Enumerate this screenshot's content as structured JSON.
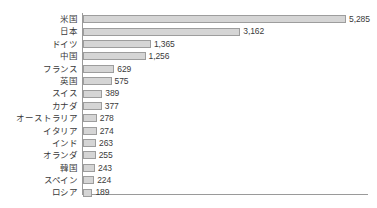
{
  "chart_data": {
    "type": "bar",
    "orientation": "horizontal",
    "title": "",
    "subtitle": "",
    "xlabel": "",
    "ylabel": "",
    "grid": false,
    "legend": null,
    "legend_position": "none",
    "xlim": [
      0,
      5285
    ],
    "axis_origin": 0,
    "value_label_format": "thousands-separated",
    "categories": [
      "米国",
      "日本",
      "ドイツ",
      "中国",
      "フランス",
      "英国",
      "スイス",
      "カナダ",
      "オーストラリア",
      "イタリア",
      "インド",
      "オランダ",
      "韓国",
      "スペイン",
      "ロシア"
    ],
    "values": [
      5285,
      3162,
      1365,
      1256,
      629,
      575,
      389,
      377,
      278,
      274,
      263,
      255,
      243,
      224,
      189
    ],
    "value_labels": [
      "5,285",
      "3,162",
      "1,365",
      "1,256",
      "629",
      "575",
      "389",
      "377",
      "278",
      "274",
      "263",
      "255",
      "243",
      "224",
      "189"
    ],
    "colors": {
      "bar_fill": "#d5d5d5",
      "bar_border": "#9d9d9d",
      "axis": "#9a9a9a",
      "text": "#3a3a3a",
      "background": "#ffffff"
    }
  }
}
